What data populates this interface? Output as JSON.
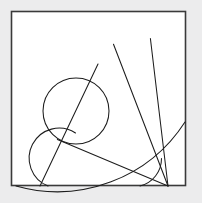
{
  "figure": {
    "canvas": {
      "width": 202,
      "height": 203
    },
    "colors": {
      "background": "#ececed",
      "paper": "#ffffff",
      "frame_stroke": "#3a3a3a",
      "curve_stroke": "#1d1d1d"
    },
    "frame": {
      "name": "bounding-square",
      "x": 11.5,
      "y": 11.5,
      "width": 174,
      "height": 174,
      "stroke_width": 1.6
    },
    "sector": {
      "name": "large-fan-sector",
      "center_x": 168,
      "center_y": 186,
      "outer_radius": 152,
      "inner_radius": 28,
      "start_angle_deg": 180,
      "end_angle_deg": 256,
      "spoke_angles_deg": [
        180,
        202,
        228,
        256
      ]
    },
    "circle_full": {
      "name": "tangent-circle",
      "center_x": 76,
      "center_y": 111,
      "radius": 33
    },
    "circle_partial": {
      "name": "lower-left-arc-circle",
      "center_x": 52,
      "center_y": 155,
      "radius": 30,
      "start_angle_deg": 300,
      "end_angle_deg": 100
    },
    "chord": {
      "name": "tangent-chord",
      "x1": 40,
      "y1": 186,
      "x2": 98,
      "y2": 64
    },
    "paths": {
      "outer_arc": "M 16 186 A 152 152 0 0 0 185 122",
      "inner_arc": "M 140 186 A 28 28 0 0 0 161.5 158.6",
      "spoke_upper": "M 168 186 L 113.5 44.2",
      "spoke_mid": "M 168 186 L 150.4 38.5",
      "spoke_low": "M 168 186 L 57.4 139.6",
      "circle_full_path": "M 76 78 A 33 33 0 1 0 76 144 A 33 33 0 1 0 76 78",
      "partial_arc": "M 48 186 A 30 30 0 1 1 75.5 133",
      "chord_path": "M 40 186 L 98 64"
    }
  }
}
